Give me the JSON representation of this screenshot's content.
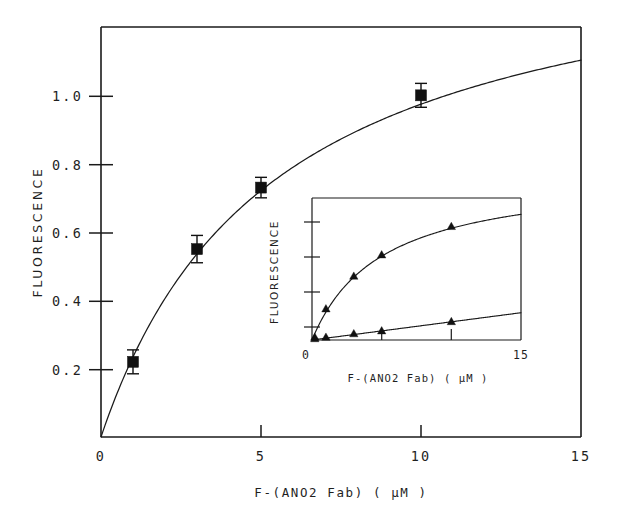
{
  "figure": {
    "background_color": "#ffffff",
    "ink_color": "#111111"
  },
  "chart_data": [
    {
      "id": "main-plot",
      "type": "scatter",
      "title": "",
      "xlabel": "F-(ANO2 Fab)  ( µM )",
      "ylabel": "FLUORESCENCE",
      "xlim": [
        0,
        15
      ],
      "ylim": [
        0,
        1.2
      ],
      "grid": false,
      "legend": "none",
      "xticks": [
        0,
        5,
        10,
        15
      ],
      "xtick_labels": [
        "0",
        "5",
        "10",
        "15"
      ],
      "yticks": [
        0.2,
        0.4,
        0.6,
        0.8,
        1.0
      ],
      "ytick_labels": [
        "0.2",
        "0.4",
        "0.6",
        "0.8",
        "1.0"
      ],
      "series": [
        {
          "name": "F-(ANO2 Fab) binding",
          "marker": "filled-square",
          "x": [
            1,
            3,
            5,
            10
          ],
          "y": [
            0.22,
            0.55,
            0.73,
            1.0
          ],
          "yerr": [
            0.035,
            0.04,
            0.03,
            0.035
          ]
        }
      ],
      "fit_curve": {
        "model": "rectangular-hyperbola",
        "description": "saturation binding fit through origin",
        "ymax": 1.5,
        "kd": 5.4,
        "x_start": 0,
        "x_end": 15
      }
    },
    {
      "id": "inset-plot",
      "type": "scatter",
      "title": "",
      "xlabel": "F-(ANO2 Fab)  ( µM )",
      "ylabel": "FLUORESCENCE",
      "xlim": [
        0,
        15
      ],
      "ylim": [
        0,
        1.0
      ],
      "grid": false,
      "legend": "none",
      "xticks": [
        0,
        5,
        10,
        15
      ],
      "xtick_labels": [
        "0",
        "",
        "",
        "15"
      ],
      "yticks_count": 4,
      "ytick_labels": [
        "0"
      ],
      "series": [
        {
          "name": "upper-curve",
          "marker": "filled-triangle",
          "x": [
            0.2,
            1,
            3,
            5,
            10
          ],
          "y": [
            0.02,
            0.22,
            0.45,
            0.6,
            0.8
          ]
        },
        {
          "name": "lower-curve",
          "marker": "filled-triangle",
          "x": [
            0.2,
            1,
            3,
            5,
            10
          ],
          "y": [
            0.01,
            0.02,
            0.045,
            0.065,
            0.13
          ]
        }
      ],
      "fit_curves": [
        {
          "name": "upper-fit",
          "model": "rectangular-hyperbola",
          "ymax": 1.18,
          "kd": 5.0
        },
        {
          "name": "lower-fit",
          "model": "linear",
          "slope": 0.0128,
          "intercept": 0.0
        }
      ]
    }
  ],
  "main_axes": {
    "x_title": "F-(ANO2 Fab)  ( µM )",
    "y_title": "FLUORESCENCE",
    "x_tick_labels": [
      "0",
      "5",
      "10",
      "15"
    ],
    "y_tick_labels": [
      "0.2",
      "0.4",
      "0.6",
      "0.8",
      "1.0"
    ]
  },
  "inset_axes": {
    "x_title": "F-(ANO2 Fab)   ( µM )",
    "y_title": "FLUORESCENCE",
    "x_tick_labels": [
      "0",
      "15"
    ],
    "y_tick_labels": [
      "0"
    ]
  }
}
